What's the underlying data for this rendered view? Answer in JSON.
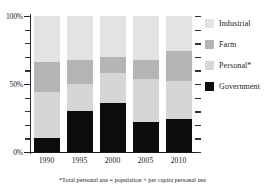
{
  "chart_data": {
    "type": "bar",
    "subtype": "stacked-percent",
    "title": "",
    "xlabel": "",
    "ylabel": "",
    "categories": [
      "1990",
      "1995",
      "2000",
      "2005",
      "2010"
    ],
    "ylim": [
      0,
      100
    ],
    "ytick_values": [
      0,
      10,
      20,
      30,
      40,
      50,
      60,
      70,
      80,
      90,
      100
    ],
    "ytick_labels": [
      "0%",
      "",
      "",
      "",
      "",
      "50%",
      "",
      "",
      "",
      "",
      "100%"
    ],
    "ytick_labeled": [
      "0%",
      "50%",
      "100%"
    ],
    "grid": false,
    "legend_position": "right",
    "stack_order_bottom_to_top": [
      "Government",
      "Personal*",
      "Farm",
      "Industrial"
    ],
    "series": [
      {
        "name": "Government",
        "color": "#0d0d0d",
        "values": [
          10,
          30,
          36,
          22,
          24
        ]
      },
      {
        "name": "Personal*",
        "color": "#d6d6d6",
        "values": [
          34,
          20,
          22,
          32,
          28
        ]
      },
      {
        "name": "Farm",
        "color": "#b5b5b5",
        "values": [
          22,
          18,
          12,
          14,
          22
        ]
      },
      {
        "name": "Industrial",
        "color": "#e3e3e3",
        "values": [
          34,
          32,
          30,
          32,
          26
        ]
      }
    ],
    "annotations": [
      "*Total personal use = population × per capita personal use"
    ]
  },
  "axis": {
    "y": {
      "label_top": "100%",
      "label_mid": "50%",
      "label_bottom": "0%"
    },
    "x": {
      "ticks": [
        "1990",
        "1995",
        "2000",
        "2005",
        "2010"
      ]
    }
  },
  "legend": {
    "items": [
      {
        "label": "Industrial",
        "color": "#e3e3e3"
      },
      {
        "label": "Farm",
        "color": "#b5b5b5"
      },
      {
        "label": "Personal*",
        "color": "#d6d6d6"
      },
      {
        "label": "Government",
        "color": "#0d0d0d"
      }
    ]
  },
  "footnote": {
    "text": "*Total personal use = population × per capita personal use"
  }
}
